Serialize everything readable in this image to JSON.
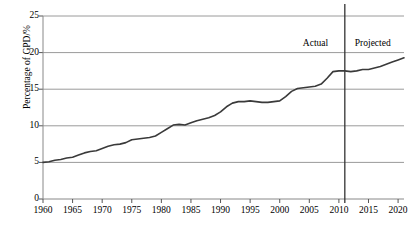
{
  "chart_data": {
    "type": "line",
    "title": "",
    "xlabel": "",
    "ylabel": "Percentage of GPD/%",
    "xlim": [
      1960,
      2021
    ],
    "ylim": [
      0,
      25
    ],
    "grid": true,
    "legend": "none",
    "xticks": [
      "1960",
      "1965",
      "1970",
      "1975",
      "1980",
      "1985",
      "1990",
      "1995",
      "2000",
      "2005",
      "2010",
      "2015",
      "2020"
    ],
    "xtick_values": [
      1960,
      1965,
      1970,
      1975,
      1980,
      1985,
      1990,
      1995,
      2000,
      2005,
      2010,
      2015,
      2020
    ],
    "yticks": [
      "0",
      "5",
      "10",
      "15",
      "20",
      "25"
    ],
    "ytick_values": [
      0,
      5,
      10,
      15,
      20,
      25
    ],
    "annotations": [
      {
        "text": "Actual",
        "x": 2003,
        "y": 22.0
      },
      {
        "text": "Projected",
        "x": 2016,
        "y": 22.0
      }
    ],
    "divider": {
      "x": 2011,
      "label_left": "Actual",
      "label_right": "Projected"
    },
    "series": [
      {
        "name": "Percentage of GPD",
        "color": "#3a3a3a",
        "x": [
          1960,
          1961,
          1962,
          1963,
          1964,
          1965,
          1966,
          1967,
          1968,
          1969,
          1970,
          1971,
          1972,
          1973,
          1974,
          1975,
          1976,
          1977,
          1978,
          1979,
          1980,
          1981,
          1982,
          1983,
          1984,
          1985,
          1986,
          1987,
          1988,
          1989,
          1990,
          1991,
          1992,
          1993,
          1994,
          1995,
          1996,
          1997,
          1998,
          1999,
          2000,
          2001,
          2002,
          2003,
          2004,
          2005,
          2006,
          2007,
          2008,
          2009,
          2010,
          2011,
          2012,
          2013,
          2014,
          2015,
          2016,
          2017,
          2018,
          2019,
          2020,
          2021
        ],
        "y": [
          5.0,
          5.1,
          5.3,
          5.4,
          5.6,
          5.7,
          6.0,
          6.3,
          6.5,
          6.6,
          6.9,
          7.2,
          7.4,
          7.5,
          7.7,
          8.1,
          8.2,
          8.3,
          8.4,
          8.6,
          9.1,
          9.6,
          10.1,
          10.2,
          10.1,
          10.4,
          10.7,
          10.9,
          11.1,
          11.4,
          11.9,
          12.6,
          13.1,
          13.3,
          13.3,
          13.4,
          13.3,
          13.2,
          13.2,
          13.3,
          13.4,
          14.0,
          14.7,
          15.1,
          15.2,
          15.3,
          15.4,
          15.7,
          16.5,
          17.4,
          17.5,
          17.5,
          17.4,
          17.5,
          17.7,
          17.7,
          17.9,
          18.1,
          18.4,
          18.7,
          19.0,
          19.3
        ]
      }
    ]
  },
  "axis": {
    "y_label_text": "Percentage of GPD/%"
  }
}
